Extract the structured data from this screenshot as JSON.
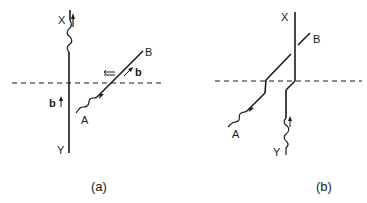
{
  "figure": {
    "panels": [
      {
        "id": "a",
        "caption": "(a)",
        "labels": {
          "x": "X",
          "y": "Y",
          "a": "A",
          "b_end": "B",
          "burgers_1": "b",
          "burgers_2": "b"
        },
        "elements": [
          "vertical dislocation line X-Y with kink near X",
          "inclined dislocation line A-B with kink near A",
          "dashed slip plane trace",
          "hollow arrow pointing left",
          "burgers vector arrows"
        ]
      },
      {
        "id": "b",
        "caption": "(b)",
        "labels": {
          "x": "X",
          "y": "Y",
          "a": "A",
          "b_end": "B"
        },
        "elements": [
          "reconnected dislocation lines after intersection",
          "jogs at dashed plane",
          "dashed slip plane trace"
        ]
      }
    ],
    "colors": {
      "line": "#1a1a1a",
      "background": "#ffffff"
    }
  }
}
